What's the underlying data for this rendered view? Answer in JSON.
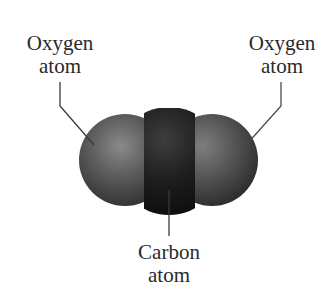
{
  "diagram": {
    "labels": {
      "left_oxygen": {
        "line1": "Oxygen",
        "line2": "atom"
      },
      "right_oxygen": {
        "line1": "Oxygen",
        "line2": "atom"
      },
      "carbon": {
        "line1": "Carbon",
        "line2": "atom"
      }
    },
    "colors": {
      "oxygen": "#5a5a5a",
      "carbon": "#1c1c1c",
      "leader_line": "#3a3a3a",
      "text": "#2a2a2a"
    }
  }
}
